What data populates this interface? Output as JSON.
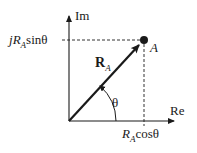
{
  "diagram": {
    "type": "phasor-complex-plane",
    "axes": {
      "real_label": "Re",
      "imag_label": "Im"
    },
    "vector": {
      "label_main": "R",
      "label_sub": "A"
    },
    "point": {
      "label": "A"
    },
    "angle": {
      "label": "θ"
    },
    "projections": {
      "imag_prefix": "j",
      "imag_main": "R",
      "imag_sub": "A",
      "imag_func": "sinθ",
      "real_main": "R",
      "real_sub": "A",
      "real_func": "cosθ"
    },
    "colors": {
      "stroke": "#1a1a1a",
      "dashed": "#333333",
      "background": "#ffffff"
    }
  }
}
